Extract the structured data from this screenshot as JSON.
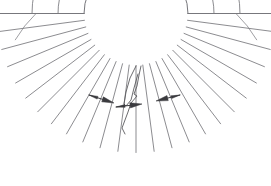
{
  "figure": {
    "background_color": "#ffffff",
    "line_color": "#77777c",
    "annotation_color": "#3a3a3e"
  },
  "geometry": {
    "center_x": 136,
    "center_y": 13.5,
    "inner_radius": 52,
    "outer_radius": 139,
    "start_angle_deg": 0,
    "end_angle_deg": 180,
    "radial_divider_count": 25,
    "concentric_arc_radii": [
      52,
      78,
      104,
      139
    ],
    "top_left_corner": "11, 14",
    "top_right_corner": "261, 14",
    "bottom_extent_y": 152
  },
  "radial_dividers_deg": [
    0,
    7.5,
    15,
    22.5,
    30,
    37.5,
    45,
    52.5,
    60,
    67.5,
    75,
    82.5,
    90,
    97.5,
    105,
    112.5,
    120,
    127.5,
    135,
    142.5,
    150,
    157.5,
    165,
    172.5,
    180
  ],
  "annotations": {
    "arrows": [
      {
        "name": "left-flow-arrow",
        "from_x": 89,
        "from_y": 95,
        "to_x": 114,
        "to_y": 103,
        "direction": "right-down"
      },
      {
        "name": "center-flow-arrow",
        "from_x": 116,
        "from_y": 107,
        "to_x": 142,
        "to_y": 104,
        "direction": "right"
      },
      {
        "name": "right-flow-arrow",
        "from_x": 180,
        "from_y": 95,
        "to_x": 156,
        "to_y": 101,
        "direction": "left-down"
      }
    ],
    "zigzag": {
      "name": "center-zigzag-detail",
      "points": "141,66 139,75 137,86 134,94 137,96 131,103 128,112 125,120 122,128 125,134"
    },
    "inner_flare": {
      "name": "center-inner-flare",
      "points": "136,66 130,78 126,92 124,104 126,106 131,100 134,88 138,74"
    }
  }
}
